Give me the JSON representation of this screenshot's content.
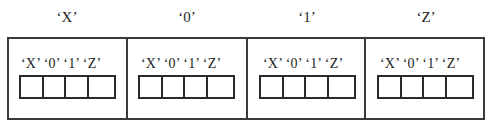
{
  "top_labels": [
    "‘X’",
    "‘0’",
    "‘1’",
    "‘Z’"
  ],
  "boxes": [
    {
      "header": "‘X’ ‘0’ ‘1’ ‘Z’",
      "cells": [
        "",
        "",
        "",
        ""
      ]
    },
    {
      "header": "‘X’ ‘0’ ‘1’ ‘Z’",
      "cells": [
        "",
        "",
        "",
        ""
      ]
    },
    {
      "header": "‘X’ ‘0’ ‘1’ ‘Z’",
      "cells": [
        "",
        "",
        "",
        ""
      ]
    },
    {
      "header": "‘X’ ‘0’ ‘1’ ‘Z’",
      "cells": [
        "",
        "",
        "",
        ""
      ]
    }
  ],
  "colors": {
    "line": "#3a3a3a",
    "text": "#1e1e1e",
    "background": "#ffffff"
  }
}
